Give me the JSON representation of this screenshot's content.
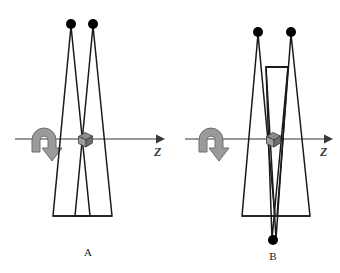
{
  "figure": {
    "background_color": "#ffffff",
    "width": 340,
    "height": 273,
    "colors": {
      "stroke": "#1a1a1a",
      "dot": "#000000",
      "axis": "#777777",
      "axis_arrow": "#3a3a3a",
      "rotation_arrow_fill": "#9a9a9a",
      "rotation_arrow_stroke": "#6f6f6f",
      "cube_top": "#8c8c8c",
      "cube_front": "#9e9e9e",
      "cube_side": "#6e6e6e",
      "cube_outline": "#3a3a3a",
      "caption_text": "#1a1a1a"
    }
  },
  "panels": [
    {
      "id": "A",
      "caption": "A",
      "caption_x": 88,
      "caption_y": 256,
      "axis": {
        "label": "Z",
        "label_x": 154,
        "label_y": 155,
        "line_x1": 15,
        "line_x2": 156,
        "line_y": 139,
        "arrow_tip_x": 164
      },
      "rotation_arrow": {
        "name": "rotation-arrow",
        "center_x": 44,
        "center_y": 140,
        "direction": "clockwise-down-right"
      },
      "cube": {
        "center_x": 85,
        "center_y": 139,
        "size": 13
      },
      "dots": [
        {
          "cx": 71,
          "cy": 24,
          "r": 5
        },
        {
          "cx": 93,
          "cy": 24,
          "r": 5
        }
      ],
      "triangles": [
        {
          "name": "triangle-left",
          "apex_x": 71,
          "apex_y": 26,
          "base_left_x": 53,
          "base_right_x": 90,
          "base_y": 216
        },
        {
          "name": "triangle-right",
          "apex_x": 93,
          "apex_y": 26,
          "base_left_x": 75,
          "base_right_x": 112,
          "base_y": 216
        }
      ],
      "base_line": {
        "x1": 53,
        "x2": 112,
        "y": 216
      },
      "extra_bar": null,
      "bottom_dot": null
    },
    {
      "id": "B",
      "caption": "B",
      "caption_x": 273,
      "caption_y": 260,
      "axis": {
        "label": "Z",
        "label_x": 320,
        "label_y": 155,
        "line_x1": 185,
        "line_x2": 324,
        "line_y": 139,
        "arrow_tip_x": 332
      },
      "rotation_arrow": {
        "name": "rotation-arrow",
        "center_x": 211,
        "center_y": 140,
        "direction": "clockwise-down-right"
      },
      "cube": {
        "center_x": 273,
        "center_y": 139,
        "size": 13
      },
      "dots": [
        {
          "cx": 258,
          "cy": 32,
          "r": 5
        },
        {
          "cx": 291,
          "cy": 32,
          "r": 5
        }
      ],
      "triangles": [
        {
          "name": "triangle-up-left",
          "apex_x": 258,
          "apex_y": 34,
          "base_left_x": 242,
          "base_right_x": 275,
          "base_y": 216
        },
        {
          "name": "triangle-up-right",
          "apex_x": 291,
          "apex_y": 34,
          "base_left_x": 277,
          "base_right_x": 310,
          "base_y": 216
        },
        {
          "name": "triangle-down-left",
          "apex_x": 272,
          "apex_y": 238,
          "base_left_x": 258,
          "base_right_x": 275,
          "base_y": 67
        },
        {
          "name": "triangle-down-right",
          "apex_x": 275,
          "apex_y": 238,
          "base_left_x": 277,
          "base_right_x": 291,
          "base_y": 67
        }
      ],
      "base_line": {
        "x1": 242,
        "x2": 310,
        "y": 216
      },
      "extra_bar": {
        "x1": 266,
        "x2": 288,
        "y": 67
      },
      "bottom_dot": {
        "cx": 273,
        "cy": 240,
        "r": 5
      }
    }
  ]
}
